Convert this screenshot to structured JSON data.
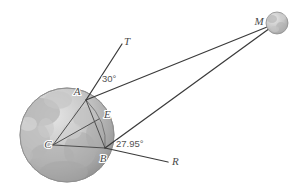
{
  "figure": {
    "background_color": "#ffffff",
    "line_color": "#3b3b3b",
    "label_color": "#4a4a4a"
  },
  "bodies": {
    "earth": {
      "name": "earth-sphere",
      "center": {
        "x": 67,
        "y": 135
      },
      "radius": 47,
      "fill_light": "#d9d9d9",
      "fill_dark": "#9a9a9a",
      "outline": "#8d8d8d"
    },
    "moon": {
      "name": "moon-sphere",
      "center": {
        "x": 277,
        "y": 23
      },
      "radius": 11,
      "fill_light": "#dcdcdc",
      "fill_dark": "#a8a8a8",
      "outline": "#8d8d8d"
    }
  },
  "points": {
    "C": {
      "label": "C",
      "x": 53,
      "y": 145,
      "lx": 48,
      "ly": 148
    },
    "A": {
      "label": "A",
      "x": 86,
      "y": 100,
      "lx": 77,
      "ly": 95
    },
    "B": {
      "label": "B",
      "x": 105,
      "y": 148,
      "lx": 103,
      "ly": 161
    },
    "E": {
      "label": "E",
      "x": 99,
      "y": 119,
      "lx": 104,
      "ly": 118
    },
    "T": {
      "label": "T",
      "x": 122,
      "y": 44,
      "lx": 124,
      "ly": 44
    },
    "R": {
      "label": "R",
      "x": 168,
      "y": 162,
      "lx": 172,
      "ly": 163
    },
    "M": {
      "label": "M",
      "x": 277,
      "y": 23,
      "lx": 258,
      "ly": 22
    }
  },
  "angles": [
    {
      "name": "angle-at-A",
      "value": "30°",
      "x": 104,
      "y": 79,
      "vertex": "A",
      "between": [
        "T",
        "M"
      ]
    },
    {
      "name": "angle-at-B",
      "value": "27.95°",
      "x": 118,
      "y": 145,
      "vertex": "B",
      "between": [
        "M",
        "R"
      ]
    }
  ],
  "segments": [
    {
      "name": "segment-A-to-T",
      "from": "A",
      "to": "T",
      "style": "ray"
    },
    {
      "name": "segment-A-to-M",
      "from": "A",
      "to": "M",
      "style": "ray"
    },
    {
      "name": "segment-B-to-M",
      "from": "B",
      "to": "M",
      "style": "ray"
    },
    {
      "name": "segment-B-to-R",
      "from": "B",
      "to": "R",
      "style": "ray"
    },
    {
      "name": "segment-C-to-A",
      "from": "C",
      "to": "A",
      "style": "thin"
    },
    {
      "name": "segment-C-to-B",
      "from": "C",
      "to": "B",
      "style": "thin"
    },
    {
      "name": "segment-C-to-E",
      "from": "C",
      "to": "E",
      "style": "thin"
    },
    {
      "name": "segment-A-to-B",
      "from": "A",
      "to": "B",
      "style": "thin"
    }
  ],
  "arc": {
    "name": "arc-A-E-B",
    "description": "Arc of Earth's limb passing through A, E and B"
  }
}
